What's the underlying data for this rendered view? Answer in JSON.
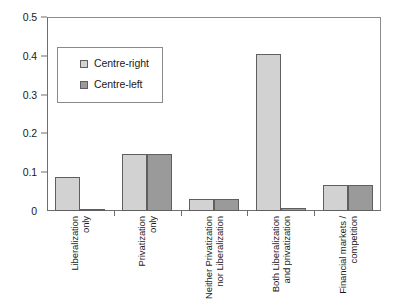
{
  "chart_data": {
    "type": "bar",
    "title": "",
    "subtitle": "",
    "xlabel": "",
    "ylabel": "",
    "ylim": [
      0,
      0.5
    ],
    "grid": false,
    "legend_position": "upper-left-inside",
    "ytick_labels": [
      "0.5",
      "0.4",
      "0.3",
      "0.2",
      "0.1",
      "0"
    ],
    "ytick_values": [
      0.5,
      0.4,
      0.3,
      0.2,
      0.1,
      0
    ],
    "categories": [
      "Liberalization only",
      "Privatization only",
      "Neither Privatization nor Liberalization",
      "Both Liberalization and privatization",
      "Financial markets / competition"
    ],
    "category_label_lines": [
      [
        "Liberalization",
        "only"
      ],
      [
        "Privatization",
        "only"
      ],
      [
        "Neither Privatization",
        "nor Liberalization"
      ],
      [
        "Both Liberalization",
        "and privatization"
      ],
      [
        "Financial markets /",
        "competition"
      ]
    ],
    "series": [
      {
        "name": "Centre-right",
        "color": "#d2d2d2",
        "values": [
          0.088,
          0.147,
          0.03,
          0.405,
          0.068
        ]
      },
      {
        "name": "Centre-left",
        "color": "#9a9a9a",
        "values": [
          0.003,
          0.147,
          0.03,
          0.008,
          0.068
        ]
      }
    ]
  },
  "legend": {
    "items": [
      {
        "label": "Centre-right",
        "swatch": "light-gray-swatch-icon"
      },
      {
        "label": "Centre-left",
        "swatch": "dark-gray-swatch-icon"
      }
    ]
  },
  "colors": {
    "centre_right": "#d2d2d2",
    "centre_left": "#9a9a9a",
    "bar_outline": "#5f5f5f",
    "axis": "#6e6e6e",
    "frame": "#8c8c8c",
    "text": "#1a1a1a",
    "background": "#ffffff"
  }
}
